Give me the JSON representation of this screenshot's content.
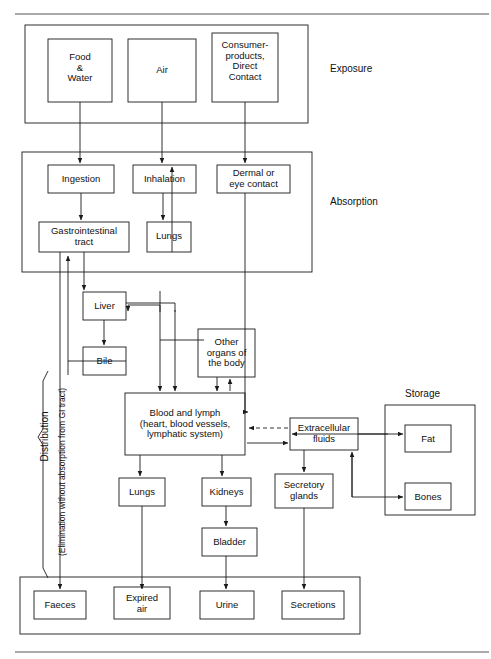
{
  "figure": {
    "type": "flow-diagram",
    "title": "",
    "stroke_color": "#1a1a1a",
    "background": "#ffffff"
  },
  "section_labels": {
    "exposure": "Exposure",
    "absorption": "Absorption",
    "distribution": "Distribution",
    "storage": "Storage",
    "elimination_note": "(Elimination without absorption from GI tract)"
  },
  "nodes": {
    "food_water": "Food\n&\nWater",
    "air": "Air",
    "consumer": "Consumer-\nproducts,\nDirect\nContact",
    "ingestion": "Ingestion",
    "inhalation": "Inhalation",
    "dermal": "Dermal or\neye contact",
    "gi_tract": "Gastrointestinal\ntract",
    "lungs_upper": "Lungs",
    "liver": "Liver",
    "bile": "Bile",
    "other_organs": "Other\norgans of\nthe body",
    "blood": "Blood and lymph\n(heart, blood vessels,\nlymphatic system)",
    "extracellular": "Extracellular\nfluids",
    "fat": "Fat",
    "bones": "Bones",
    "lungs_lower": "Lungs",
    "kidneys": "Kidneys",
    "secretory": "Secretory\nglands",
    "bladder": "Bladder",
    "faeces": "Faeces",
    "expired_air": "Expired\nair",
    "urine": "Urine",
    "secretions": "Secretions"
  },
  "chart_data": {
    "type": "diagram",
    "groups": [
      {
        "name": "Exposure",
        "members": [
          "Food & Water",
          "Air",
          "Consumer-products, Direct Contact"
        ]
      },
      {
        "name": "Absorption",
        "members": [
          "Ingestion",
          "Inhalation",
          "Dermal or eye contact",
          "Gastrointestinal tract",
          "Lungs"
        ]
      },
      {
        "name": "Distribution",
        "members": [
          "Liver",
          "Bile",
          "Other organs of the body",
          "Blood and lymph",
          "Extracellular fluids",
          "Lungs",
          "Kidneys",
          "Secretory glands",
          "Bladder"
        ]
      },
      {
        "name": "Storage",
        "members": [
          "Fat",
          "Bones"
        ]
      },
      {
        "name": "Excretion",
        "members": [
          "Faeces",
          "Expired air",
          "Urine",
          "Secretions"
        ]
      }
    ],
    "edges": [
      {
        "from": "Food & Water",
        "to": "Ingestion",
        "style": "solid"
      },
      {
        "from": "Air",
        "to": "Inhalation",
        "style": "solid"
      },
      {
        "from": "Consumer-products, Direct Contact",
        "to": "Dermal or eye contact",
        "style": "solid"
      },
      {
        "from": "Ingestion",
        "to": "Gastrointestinal tract",
        "style": "solid"
      },
      {
        "from": "Inhalation",
        "to": "Lungs",
        "style": "solid"
      },
      {
        "from": "Lungs",
        "to": "Inhalation",
        "style": "solid"
      },
      {
        "from": "Gastrointestinal tract",
        "to": "Liver",
        "style": "solid"
      },
      {
        "from": "Gastrointestinal tract",
        "to": "Faeces",
        "style": "solid"
      },
      {
        "from": "Liver",
        "to": "Bile",
        "style": "solid"
      },
      {
        "from": "Bile",
        "to": "Gastrointestinal tract",
        "style": "solid"
      },
      {
        "from": "Liver",
        "to": "Blood and lymph",
        "style": "solid"
      },
      {
        "from": "Blood and lymph",
        "to": "Liver",
        "style": "solid"
      },
      {
        "from": "Lungs (upper)",
        "to": "Blood and lymph",
        "style": "solid"
      },
      {
        "from": "Dermal or eye contact",
        "to": "Blood and lymph",
        "style": "solid"
      },
      {
        "from": "Blood and lymph",
        "to": "Other organs of the body",
        "style": "solid"
      },
      {
        "from": "Other organs of the body",
        "to": "Blood and lymph",
        "style": "solid"
      },
      {
        "from": "Extracellular fluids",
        "to": "Blood and lymph",
        "style": "dashed"
      },
      {
        "from": "Blood and lymph",
        "to": "Extracellular fluids",
        "style": "solid"
      },
      {
        "from": "Extracellular fluids",
        "to": "Fat",
        "style": "solid-bidirectional"
      },
      {
        "from": "Bones",
        "to": "Extracellular fluids",
        "style": "solid-bidirectional"
      },
      {
        "from": "Extracellular fluids",
        "to": "Secretory glands",
        "style": "solid"
      },
      {
        "from": "Blood and lymph",
        "to": "Lungs (lower)",
        "style": "solid"
      },
      {
        "from": "Blood and lymph",
        "to": "Kidneys",
        "style": "solid"
      },
      {
        "from": "Kidneys",
        "to": "Bladder",
        "style": "solid"
      },
      {
        "from": "Lungs (lower)",
        "to": "Expired air",
        "style": "solid"
      },
      {
        "from": "Bladder",
        "to": "Urine",
        "style": "solid"
      },
      {
        "from": "Secretory glands",
        "to": "Secretions",
        "style": "solid"
      }
    ]
  }
}
